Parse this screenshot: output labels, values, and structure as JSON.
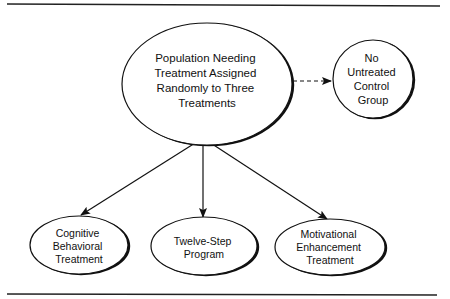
{
  "diagram": {
    "type": "flow-diagram",
    "nodes": {
      "population": {
        "lines": [
          "Population Needing",
          "Treatment Assigned",
          "Randomly to Three",
          "Treatments"
        ]
      },
      "control": {
        "lines": [
          "No",
          "Untreated",
          "Control",
          "Group"
        ]
      },
      "cognitive": {
        "lines": [
          "Cognitive",
          "Behavioral",
          "Treatment"
        ]
      },
      "twelve_step": {
        "lines": [
          "Twelve-Step",
          "Program"
        ]
      },
      "motivational": {
        "lines": [
          "Motivational",
          "Enhancement",
          "Treatment"
        ]
      }
    },
    "edges": [
      {
        "from": "population",
        "to": "control",
        "style": "dashed"
      },
      {
        "from": "population",
        "to": "cognitive",
        "style": "solid"
      },
      {
        "from": "population",
        "to": "twelve_step",
        "style": "solid"
      },
      {
        "from": "population",
        "to": "motivational",
        "style": "solid"
      }
    ],
    "colors": {
      "stroke": "#111111",
      "background": "#ffffff"
    }
  }
}
